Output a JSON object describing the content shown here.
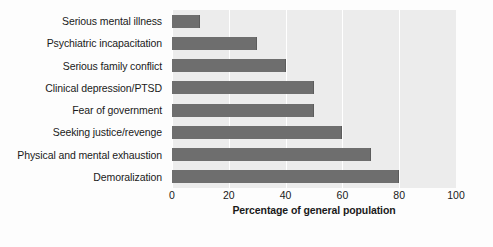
{
  "chart_data": {
    "type": "bar",
    "orientation": "horizontal",
    "title": "",
    "xlabel": "Percentage of general population",
    "ylabel": "",
    "categories": [
      "Serious mental illness",
      "Psychiatric incapacitation",
      "Serious family conflict",
      "Clinical depression/PTSD",
      "Fear of government",
      "Seeking justice/revenge",
      "Physical and mental exhaustion",
      "Demoralization"
    ],
    "values": [
      10,
      30,
      40,
      50,
      50,
      60,
      70,
      80
    ],
    "xlim": [
      0,
      100
    ],
    "xticks": [
      0,
      20,
      40,
      60,
      80,
      100
    ],
    "xtick_labels": [
      "0",
      "20",
      "40",
      "60",
      "80",
      "100"
    ],
    "grid": true,
    "grid_axis": "x",
    "legend": false,
    "colors": {
      "bar": "#6e6e6e",
      "bar_edge": "#5c5c5c",
      "plot_background": "#ececec",
      "gridline": "#ffffff",
      "figure_background": "#fdfdfd",
      "text": "#1a1a1a"
    }
  }
}
